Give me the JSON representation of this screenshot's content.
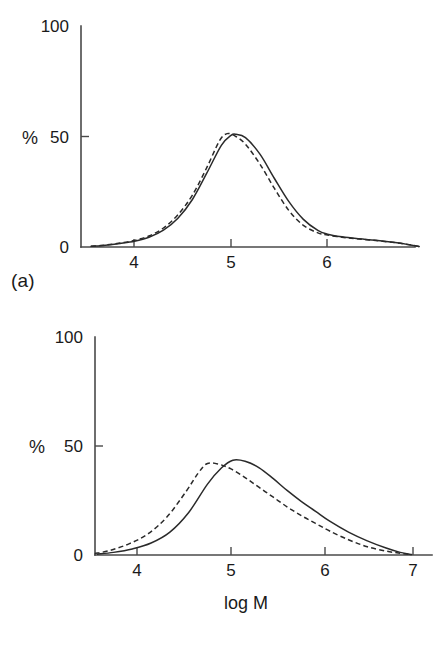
{
  "figure": {
    "panel_a_label": "(a)",
    "panel_b_label": "(b)"
  },
  "chart_data": [
    {
      "id": "panel-a",
      "type": "line",
      "title": "",
      "subtitle": "",
      "panel_label": "(a)",
      "xlabel": "",
      "ylabel": "%",
      "xlim": [
        3.45,
        7.0
      ],
      "ylim": [
        0,
        100
      ],
      "xticks": [
        4,
        5,
        6
      ],
      "xtick_labels": [
        "4",
        "5",
        "6"
      ],
      "yticks": [
        0,
        50,
        100
      ],
      "ytick_labels": [
        "0",
        "50",
        "100"
      ],
      "grid": false,
      "legend": "none",
      "annotations": [],
      "series": [
        {
          "name": "solid curve",
          "style": "solid",
          "color": "#2a2a2a",
          "x": [
            3.55,
            3.7,
            3.85,
            4.0,
            4.15,
            4.3,
            4.45,
            4.6,
            4.75,
            4.9,
            5.0,
            5.05,
            5.15,
            5.3,
            5.45,
            5.6,
            5.75,
            5.9,
            6.0,
            6.15,
            6.3,
            6.5,
            6.7,
            6.85,
            6.95
          ],
          "y": [
            0.3,
            0.8,
            1.6,
            2.6,
            4.4,
            7.6,
            13.0,
            21.5,
            33.5,
            46.0,
            50.5,
            51.0,
            49.5,
            42.0,
            31.0,
            20.5,
            12.5,
            7.5,
            5.8,
            4.6,
            3.8,
            3.0,
            2.0,
            1.0,
            0.2
          ]
        },
        {
          "name": "dashed curve",
          "style": "dashed",
          "color": "#2a2a2a",
          "x": [
            3.55,
            3.7,
            3.85,
            4.0,
            4.15,
            4.3,
            4.45,
            4.6,
            4.75,
            4.88,
            4.96,
            5.05,
            5.15,
            5.3,
            5.45,
            5.6,
            5.75,
            5.9,
            6.0,
            6.15,
            6.3,
            6.5,
            6.7,
            6.85,
            6.95
          ],
          "y": [
            0.3,
            0.9,
            1.8,
            3.0,
            5.0,
            8.6,
            14.6,
            23.5,
            36.0,
            48.0,
            51.3,
            50.0,
            46.5,
            37.5,
            26.5,
            16.5,
            9.8,
            6.4,
            5.4,
            4.4,
            3.7,
            2.9,
            2.0,
            1.0,
            0.2
          ]
        }
      ]
    },
    {
      "id": "panel-b",
      "type": "line",
      "title": "",
      "subtitle": "",
      "panel_label": "(b)",
      "xlabel": "log M",
      "ylabel": "%",
      "xlim": [
        3.45,
        7.05
      ],
      "ylim": [
        0,
        100
      ],
      "xticks": [
        4,
        5,
        6,
        7
      ],
      "xtick_labels": [
        "4",
        "5",
        "6",
        "7"
      ],
      "yticks": [
        0,
        50,
        100
      ],
      "ytick_labels": [
        "0",
        "50",
        "100"
      ],
      "grid": false,
      "legend": "none",
      "annotations": [],
      "series": [
        {
          "name": "solid curve",
          "style": "solid",
          "color": "#2a2a2a",
          "x": [
            3.58,
            3.75,
            3.95,
            4.15,
            4.35,
            4.55,
            4.75,
            4.9,
            5.02,
            5.15,
            5.3,
            5.45,
            5.6,
            5.75,
            5.9,
            6.05,
            6.25,
            6.45,
            6.65,
            6.8,
            6.92
          ],
          "y": [
            0.4,
            1.2,
            2.8,
            5.5,
            10.5,
            19.5,
            32.5,
            40.0,
            43.5,
            43.0,
            40.0,
            35.0,
            29.5,
            24.5,
            20.0,
            15.5,
            10.5,
            6.5,
            3.2,
            1.2,
            0.2
          ]
        },
        {
          "name": "dashed curve",
          "style": "dashed",
          "color": "#2a2a2a",
          "x": [
            3.55,
            3.72,
            3.92,
            4.12,
            4.32,
            4.52,
            4.65,
            4.75,
            4.88,
            5.0,
            5.15,
            5.3,
            5.45,
            5.6,
            5.75,
            5.9,
            6.05,
            6.25,
            6.45,
            6.65,
            6.8,
            6.92
          ],
          "y": [
            0.6,
            2.2,
            5.2,
            9.8,
            17.5,
            29.0,
            37.5,
            42.0,
            41.5,
            39.5,
            35.5,
            31.0,
            26.5,
            22.0,
            18.0,
            14.5,
            11.0,
            7.0,
            3.8,
            1.8,
            0.8,
            0.2
          ]
        }
      ]
    }
  ]
}
